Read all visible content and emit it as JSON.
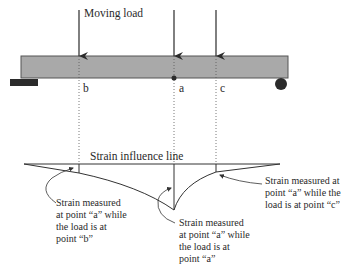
{
  "diagram": {
    "moving_load_label": "Moving load",
    "points": {
      "b": "b",
      "a": "a",
      "c": "c"
    },
    "influence_line_title": "Strain influence line",
    "annotations": {
      "load_at_b": [
        "Strain measured",
        "at point “a” while",
        "the load is at",
        "point “b”"
      ],
      "load_at_a": [
        "Strain measured",
        "at point “a” while",
        "the load is at",
        "point “a”"
      ],
      "load_at_c": [
        "Strain measured at",
        "point “a” while the",
        "load is at point “c”"
      ]
    },
    "colors": {
      "beam_fill": "#a9a9a9",
      "beam_stroke": "#555555",
      "support": "#2b2b2b",
      "line": "#333333"
    }
  }
}
